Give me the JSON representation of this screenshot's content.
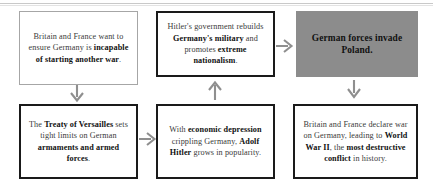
{
  "diagram": {
    "colors": {
      "box_border_gray": "#a6a6a6",
      "box_border_black": "#1a1a1a",
      "highlight_fill": "#8c8c8c",
      "arrow": "#8f8f8f",
      "body_text": "#3a3a3a",
      "bold_text": "#111111",
      "background": "#ffffff"
    },
    "nodes": [
      {
        "id": "versailles-intent",
        "style": "outline-gray",
        "plain_text": "Britain and France want to ensure Germany is incapable of starting another war.",
        "runs": [
          {
            "text": "Britain and France want to ensure Germany is ",
            "bold": false
          },
          {
            "text": "incapable of starting another war",
            "bold": true
          },
          {
            "text": ".",
            "bold": false
          }
        ]
      },
      {
        "id": "treaty",
        "style": "outline-black",
        "plain_text": "The Treaty of Versailles sets tight limits on German armaments and armed forces.",
        "runs": [
          {
            "text": "The ",
            "bold": false
          },
          {
            "text": "Treaty of Versailles",
            "bold": true
          },
          {
            "text": " sets tight limits on German ",
            "bold": false
          },
          {
            "text": "armaments and armed forces",
            "bold": true
          },
          {
            "text": ".",
            "bold": false
          }
        ]
      },
      {
        "id": "depression",
        "style": "outline-black",
        "plain_text": "With economic depression crippling Germany, Adolf Hitler grows in popularity.",
        "runs": [
          {
            "text": "With ",
            "bold": false
          },
          {
            "text": "economic depression",
            "bold": true
          },
          {
            "text": " crippling Germany, ",
            "bold": false
          },
          {
            "text": "Adolf Hitler",
            "bold": true
          },
          {
            "text": " grows in popularity.",
            "bold": false
          }
        ]
      },
      {
        "id": "rearmament",
        "style": "outline-black",
        "plain_text": "Hitler's government rebuilds Germany's military and promotes extreme nationalism.",
        "runs": [
          {
            "text": "Hitler's government rebuilds ",
            "bold": false
          },
          {
            "text": "Germany's military",
            "bold": true
          },
          {
            "text": " and promotes ",
            "bold": false
          },
          {
            "text": "extreme nationalism",
            "bold": true
          },
          {
            "text": ".",
            "bold": false
          }
        ]
      },
      {
        "id": "invasion",
        "style": "filled-gray",
        "plain_text": "German forces invade Poland.",
        "runs": [
          {
            "text": "German forces invade Poland.",
            "bold": true
          }
        ]
      },
      {
        "id": "declaration",
        "style": "outline-black",
        "plain_text": "Britain and France declare war on Germany, leading to World War II, the most destructive conflict in history.",
        "runs": [
          {
            "text": "Britain and France declare war on Germany, leading to ",
            "bold": false
          },
          {
            "text": "World War II",
            "bold": true
          },
          {
            "text": ", the ",
            "bold": false
          },
          {
            "text": "most destructive conflict",
            "bold": true
          },
          {
            "text": " in history.",
            "bold": false
          }
        ]
      }
    ],
    "arrows": [
      {
        "id": "down-left",
        "from": "versailles-intent",
        "to": "treaty",
        "direction": "down"
      },
      {
        "id": "right-lower",
        "from": "treaty",
        "to": "depression",
        "direction": "right"
      },
      {
        "id": "up-middle",
        "from": "depression",
        "to": "rearmament",
        "direction": "up"
      },
      {
        "id": "right-upper",
        "from": "rearmament",
        "to": "invasion",
        "direction": "right"
      },
      {
        "id": "down-right",
        "from": "invasion",
        "to": "declaration",
        "direction": "down"
      }
    ]
  }
}
